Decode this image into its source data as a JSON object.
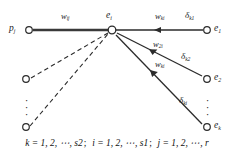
{
  "figure": {
    "background_color": "#ffffff",
    "line_color": "#333333",
    "text_color": "#1a1a1a"
  },
  "nodes": {
    "input": {
      "symbol": "p",
      "subscript": "j",
      "x": 29,
      "y": 30
    },
    "hidden": {
      "symbol": "e",
      "subscript": "i",
      "x": 112,
      "y": 30
    },
    "outputs": [
      {
        "symbol": "e",
        "subscript": "1",
        "x": 207,
        "y": 30
      },
      {
        "symbol": "e",
        "subscript": "2",
        "x": 207,
        "y": 79
      },
      {
        "symbol": "e",
        "subscript": "k",
        "x": 207,
        "y": 127
      }
    ],
    "unlabeled_inputs": [
      {
        "x": 26,
        "y": 79
      },
      {
        "x": 26,
        "y": 127
      }
    ]
  },
  "edges": {
    "input_solid": {
      "label": "w",
      "subscript": "ij",
      "style": "solid-thick"
    },
    "input_dashed_count": 2,
    "outputs": [
      {
        "weight": "w",
        "weight_sub": "ki",
        "delta": "δ",
        "delta_sub": "k1"
      },
      {
        "weight": "w",
        "weight_sub": "2i",
        "delta": "δ",
        "delta_sub": "k2"
      },
      {
        "weight": "w",
        "weight_sub": "ki",
        "delta": "δ",
        "delta_sub": "ki"
      }
    ]
  },
  "labels": {
    "w_input": {
      "base": "w",
      "sub": "ij"
    },
    "w_out1": {
      "base": "w",
      "sub": "ki"
    },
    "w_out2": {
      "base": "w",
      "sub": "2i"
    },
    "w_out3": {
      "base": "w",
      "sub": "ki"
    },
    "d_out1": {
      "base": "δ",
      "sub": "k1"
    },
    "d_out2": {
      "base": "δ",
      "sub": "k2"
    },
    "d_out3": {
      "base": "δ",
      "sub": "ki"
    },
    "node_p": {
      "base": "p",
      "sub": "j"
    },
    "node_e": {
      "base": "e",
      "sub": "i"
    },
    "node_e1": {
      "base": "e",
      "sub": "1"
    },
    "node_e2": {
      "base": "e",
      "sub": "2"
    },
    "node_ek": {
      "base": "e",
      "sub": "k"
    }
  },
  "ellipsis": {
    "glyph": "·",
    "left": "vertical-dots-left",
    "right": "vertical-dots-right"
  },
  "caption": {
    "k_range": "k = 1, 2, ⋯, s2",
    "sep1": ";",
    "i_range": "i = 1, 2, ⋯, s1",
    "sep2": ";",
    "j_range": "j = 1, 2, ⋯, r",
    "full": "k = 1, 2, ⋯, s2 ;  i = 1, 2, ⋯, s1 ;  j = 1, 2, ⋯, r"
  }
}
